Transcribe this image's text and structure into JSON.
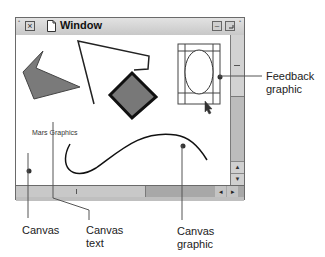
{
  "window": {
    "title": "Window",
    "close_glyph": "×",
    "zoom_glyph": "–",
    "collapse_glyph": "▫",
    "corner_dot": "•"
  },
  "canvas": {
    "text": "Mars Graphics",
    "shapes": [
      {
        "type": "polygon",
        "name": "filled-arrow-polygon",
        "fill": "#7a7a7a"
      },
      {
        "type": "polyline",
        "name": "open-polyline"
      },
      {
        "type": "polygon",
        "name": "filled-diamond",
        "fill": "#787878",
        "stroke": "#111111"
      },
      {
        "type": "ellipse",
        "name": "selected-ellipse",
        "state": "feedback"
      },
      {
        "type": "curve",
        "name": "bezier-curve"
      }
    ]
  },
  "scrollbars": {
    "vertical": {
      "up_glyph": "▲",
      "down_glyph": "▼"
    },
    "horizontal": {
      "left_glyph": "◂",
      "right_glyph": "▸"
    }
  },
  "callouts": [
    {
      "id": "feedback",
      "text_line1": "Feedback",
      "text_line2": "graphic"
    },
    {
      "id": "canvas",
      "text_line1": "Canvas",
      "text_line2": ""
    },
    {
      "id": "canvas-text",
      "text_line1": "Canvas",
      "text_line2": "text"
    },
    {
      "id": "canvas-graphic",
      "text_line1": "Canvas",
      "text_line2": "graphic"
    }
  ],
  "colors": {
    "shape_fill": "#7a7a7a",
    "scroll_track": "#a8a8a8",
    "scroll_thumb": "#c8c8c8"
  }
}
